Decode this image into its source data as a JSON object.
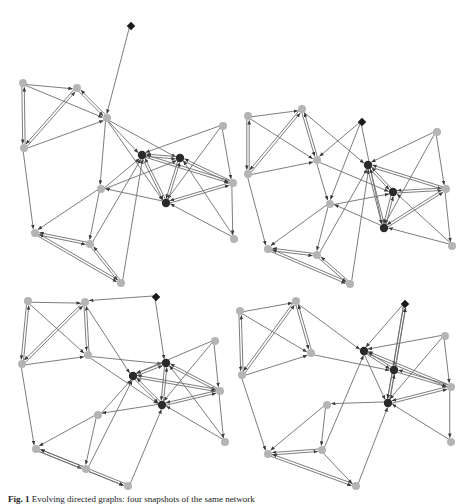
{
  "figure": {
    "caption_label": "Fig. 1",
    "caption_text": "Evolving directed graphs: four snapshots of the same network",
    "colors": {
      "edge": "#6e6e6e",
      "node_light": "#b4b4b4",
      "node_dark": "#2a2a2a",
      "diamond": "#1a1a1a"
    },
    "panels": [
      {
        "name": "panel-top-left",
        "nodes": [
          {
            "id": "d",
            "x": 131,
            "y": 26,
            "type": "diamond"
          },
          {
            "id": "a",
            "x": 23,
            "y": 83,
            "type": "light"
          },
          {
            "id": "b",
            "x": 77,
            "y": 88,
            "type": "light"
          },
          {
            "id": "c",
            "x": 107,
            "y": 118,
            "type": "light"
          },
          {
            "id": "e",
            "x": 223,
            "y": 126,
            "type": "light"
          },
          {
            "id": "f",
            "x": 24,
            "y": 148,
            "type": "light"
          },
          {
            "id": "g",
            "x": 142,
            "y": 155,
            "type": "dark"
          },
          {
            "id": "h",
            "x": 180,
            "y": 158,
            "type": "dark"
          },
          {
            "id": "i",
            "x": 233,
            "y": 183,
            "type": "light"
          },
          {
            "id": "j",
            "x": 101,
            "y": 189,
            "type": "light"
          },
          {
            "id": "k",
            "x": 166,
            "y": 203,
            "type": "dark"
          },
          {
            "id": "l",
            "x": 35,
            "y": 233,
            "type": "light"
          },
          {
            "id": "m",
            "x": 90,
            "y": 244,
            "type": "light"
          },
          {
            "id": "n",
            "x": 234,
            "y": 239,
            "type": "light"
          },
          {
            "id": "o",
            "x": 121,
            "y": 283,
            "type": "light"
          }
        ],
        "edges": [
          [
            "d",
            "c"
          ],
          [
            "a",
            "b"
          ],
          [
            "a",
            "f"
          ],
          [
            "f",
            "a"
          ],
          [
            "a",
            "c"
          ],
          [
            "b",
            "f"
          ],
          [
            "f",
            "b"
          ],
          [
            "b",
            "c"
          ],
          [
            "c",
            "b"
          ],
          [
            "f",
            "c"
          ],
          [
            "c",
            "j"
          ],
          [
            "c",
            "g"
          ],
          [
            "c",
            "h"
          ],
          [
            "c",
            "k"
          ],
          [
            "e",
            "g"
          ],
          [
            "e",
            "i"
          ],
          [
            "e",
            "k"
          ],
          [
            "g",
            "h"
          ],
          [
            "h",
            "g"
          ],
          [
            "g",
            "i"
          ],
          [
            "h",
            "i"
          ],
          [
            "i",
            "g"
          ],
          [
            "i",
            "h"
          ],
          [
            "g",
            "k"
          ],
          [
            "k",
            "g"
          ],
          [
            "h",
            "k"
          ],
          [
            "k",
            "h"
          ],
          [
            "i",
            "k"
          ],
          [
            "k",
            "i"
          ],
          [
            "j",
            "g"
          ],
          [
            "j",
            "h"
          ],
          [
            "k",
            "j"
          ],
          [
            "n",
            "k"
          ],
          [
            "n",
            "h"
          ],
          [
            "i",
            "n"
          ],
          [
            "f",
            "l"
          ],
          [
            "j",
            "l"
          ],
          [
            "j",
            "m"
          ],
          [
            "l",
            "m"
          ],
          [
            "m",
            "l"
          ],
          [
            "l",
            "o"
          ],
          [
            "o",
            "l"
          ],
          [
            "m",
            "o"
          ],
          [
            "o",
            "m"
          ],
          [
            "o",
            "g"
          ],
          [
            "m",
            "g"
          ]
        ]
      },
      {
        "name": "panel-top-right",
        "nodes": [
          {
            "id": "a",
            "x": 248,
            "y": 116,
            "type": "light"
          },
          {
            "id": "b",
            "x": 302,
            "y": 109,
            "type": "light"
          },
          {
            "id": "d",
            "x": 362,
            "y": 122,
            "type": "diamond"
          },
          {
            "id": "e",
            "x": 437,
            "y": 132,
            "type": "light"
          },
          {
            "id": "c",
            "x": 317,
            "y": 160,
            "type": "light"
          },
          {
            "id": "g",
            "x": 368,
            "y": 165,
            "type": "dark"
          },
          {
            "id": "f",
            "x": 248,
            "y": 174,
            "type": "light"
          },
          {
            "id": "h",
            "x": 393,
            "y": 192,
            "type": "dark"
          },
          {
            "id": "i",
            "x": 446,
            "y": 189,
            "type": "light"
          },
          {
            "id": "j",
            "x": 330,
            "y": 204,
            "type": "light"
          },
          {
            "id": "k",
            "x": 384,
            "y": 228,
            "type": "dark"
          },
          {
            "id": "l",
            "x": 268,
            "y": 249,
            "type": "light"
          },
          {
            "id": "m",
            "x": 317,
            "y": 255,
            "type": "light"
          },
          {
            "id": "n",
            "x": 452,
            "y": 246,
            "type": "light"
          },
          {
            "id": "o",
            "x": 350,
            "y": 284,
            "type": "light"
          }
        ],
        "edges": [
          [
            "a",
            "b"
          ],
          [
            "a",
            "f"
          ],
          [
            "f",
            "a"
          ],
          [
            "a",
            "c"
          ],
          [
            "b",
            "f"
          ],
          [
            "f",
            "b"
          ],
          [
            "b",
            "c"
          ],
          [
            "c",
            "b"
          ],
          [
            "f",
            "c"
          ],
          [
            "b",
            "g"
          ],
          [
            "d",
            "c"
          ],
          [
            "d",
            "k"
          ],
          [
            "d",
            "j"
          ],
          [
            "c",
            "j"
          ],
          [
            "c",
            "h"
          ],
          [
            "e",
            "g"
          ],
          [
            "e",
            "i"
          ],
          [
            "e",
            "k"
          ],
          [
            "g",
            "h"
          ],
          [
            "h",
            "g"
          ],
          [
            "g",
            "i"
          ],
          [
            "i",
            "g"
          ],
          [
            "h",
            "i"
          ],
          [
            "i",
            "h"
          ],
          [
            "g",
            "k"
          ],
          [
            "k",
            "g"
          ],
          [
            "h",
            "k"
          ],
          [
            "k",
            "h"
          ],
          [
            "i",
            "k"
          ],
          [
            "k",
            "i"
          ],
          [
            "j",
            "h"
          ],
          [
            "k",
            "j"
          ],
          [
            "n",
            "k"
          ],
          [
            "n",
            "h"
          ],
          [
            "i",
            "n"
          ],
          [
            "f",
            "l"
          ],
          [
            "j",
            "l"
          ],
          [
            "j",
            "m"
          ],
          [
            "l",
            "m"
          ],
          [
            "m",
            "l"
          ],
          [
            "l",
            "o"
          ],
          [
            "o",
            "l"
          ],
          [
            "m",
            "o"
          ],
          [
            "o",
            "m"
          ],
          [
            "o",
            "g"
          ],
          [
            "m",
            "g"
          ]
        ]
      },
      {
        "name": "panel-bottom-left",
        "nodes": [
          {
            "id": "a",
            "x": 28,
            "y": 301,
            "type": "light"
          },
          {
            "id": "b",
            "x": 85,
            "y": 302,
            "type": "light"
          },
          {
            "id": "d",
            "x": 156,
            "y": 297,
            "type": "diamond"
          },
          {
            "id": "e",
            "x": 215,
            "y": 341,
            "type": "light"
          },
          {
            "id": "c",
            "x": 88,
            "y": 355,
            "type": "light"
          },
          {
            "id": "f",
            "x": 22,
            "y": 364,
            "type": "light"
          },
          {
            "id": "h",
            "x": 166,
            "y": 363,
            "type": "dark"
          },
          {
            "id": "g",
            "x": 133,
            "y": 376,
            "type": "dark"
          },
          {
            "id": "i",
            "x": 220,
            "y": 391,
            "type": "light"
          },
          {
            "id": "k",
            "x": 162,
            "y": 405,
            "type": "dark"
          },
          {
            "id": "j",
            "x": 98,
            "y": 415,
            "type": "light"
          },
          {
            "id": "n",
            "x": 225,
            "y": 442,
            "type": "light"
          },
          {
            "id": "l",
            "x": 36,
            "y": 449,
            "type": "light"
          },
          {
            "id": "m",
            "x": 86,
            "y": 469,
            "type": "light"
          },
          {
            "id": "o",
            "x": 128,
            "y": 486,
            "type": "light"
          }
        ],
        "edges": [
          [
            "a",
            "b"
          ],
          [
            "a",
            "f"
          ],
          [
            "f",
            "a"
          ],
          [
            "a",
            "c"
          ],
          [
            "b",
            "f"
          ],
          [
            "f",
            "b"
          ],
          [
            "b",
            "c"
          ],
          [
            "c",
            "b"
          ],
          [
            "f",
            "c"
          ],
          [
            "d",
            "b"
          ],
          [
            "d",
            "h"
          ],
          [
            "c",
            "h"
          ],
          [
            "b",
            "g"
          ],
          [
            "c",
            "k"
          ],
          [
            "e",
            "g"
          ],
          [
            "e",
            "i"
          ],
          [
            "e",
            "k"
          ],
          [
            "g",
            "h"
          ],
          [
            "h",
            "g"
          ],
          [
            "g",
            "i"
          ],
          [
            "h",
            "i"
          ],
          [
            "i",
            "g"
          ],
          [
            "i",
            "h"
          ],
          [
            "g",
            "k"
          ],
          [
            "k",
            "g"
          ],
          [
            "h",
            "k"
          ],
          [
            "k",
            "h"
          ],
          [
            "i",
            "k"
          ],
          [
            "k",
            "i"
          ],
          [
            "j",
            "g"
          ],
          [
            "k",
            "j"
          ],
          [
            "n",
            "k"
          ],
          [
            "n",
            "h"
          ],
          [
            "i",
            "n"
          ],
          [
            "f",
            "l"
          ],
          [
            "j",
            "l"
          ],
          [
            "j",
            "m"
          ],
          [
            "l",
            "m"
          ],
          [
            "m",
            "l"
          ],
          [
            "l",
            "o"
          ],
          [
            "o",
            "l"
          ],
          [
            "m",
            "o"
          ],
          [
            "o",
            "k"
          ],
          [
            "m",
            "g"
          ]
        ]
      },
      {
        "name": "panel-bottom-right",
        "nodes": [
          {
            "id": "a",
            "x": 240,
            "y": 311,
            "type": "light"
          },
          {
            "id": "b",
            "x": 296,
            "y": 301,
            "type": "light"
          },
          {
            "id": "d",
            "x": 405,
            "y": 304,
            "type": "diamond"
          },
          {
            "id": "e",
            "x": 445,
            "y": 336,
            "type": "light"
          },
          {
            "id": "c",
            "x": 311,
            "y": 353,
            "type": "light"
          },
          {
            "id": "g",
            "x": 364,
            "y": 351,
            "type": "dark"
          },
          {
            "id": "f",
            "x": 242,
            "y": 375,
            "type": "light"
          },
          {
            "id": "h",
            "x": 394,
            "y": 370,
            "type": "dark"
          },
          {
            "id": "i",
            "x": 451,
            "y": 387,
            "type": "light"
          },
          {
            "id": "k",
            "x": 388,
            "y": 403,
            "type": "dark"
          },
          {
            "id": "j",
            "x": 327,
            "y": 405,
            "type": "light"
          },
          {
            "id": "n",
            "x": 451,
            "y": 442,
            "type": "light"
          },
          {
            "id": "l",
            "x": 268,
            "y": 454,
            "type": "light"
          },
          {
            "id": "m",
            "x": 322,
            "y": 450,
            "type": "light"
          },
          {
            "id": "o",
            "x": 356,
            "y": 486,
            "type": "light"
          }
        ],
        "edges": [
          [
            "a",
            "b"
          ],
          [
            "a",
            "f"
          ],
          [
            "f",
            "a"
          ],
          [
            "a",
            "c"
          ],
          [
            "b",
            "f"
          ],
          [
            "f",
            "b"
          ],
          [
            "b",
            "c"
          ],
          [
            "c",
            "b"
          ],
          [
            "f",
            "c"
          ],
          [
            "b",
            "g"
          ],
          [
            "d",
            "g"
          ],
          [
            "d",
            "h"
          ],
          [
            "h",
            "d"
          ],
          [
            "d",
            "k"
          ],
          [
            "k",
            "d"
          ],
          [
            "c",
            "h"
          ],
          [
            "e",
            "g"
          ],
          [
            "e",
            "i"
          ],
          [
            "e",
            "k"
          ],
          [
            "g",
            "h"
          ],
          [
            "h",
            "g"
          ],
          [
            "g",
            "i"
          ],
          [
            "h",
            "i"
          ],
          [
            "i",
            "g"
          ],
          [
            "i",
            "h"
          ],
          [
            "g",
            "k"
          ],
          [
            "h",
            "k"
          ],
          [
            "k",
            "h"
          ],
          [
            "i",
            "k"
          ],
          [
            "k",
            "i"
          ],
          [
            "k",
            "j"
          ],
          [
            "n",
            "k"
          ],
          [
            "i",
            "n"
          ],
          [
            "f",
            "l"
          ],
          [
            "j",
            "l"
          ],
          [
            "j",
            "m"
          ],
          [
            "l",
            "m"
          ],
          [
            "m",
            "l"
          ],
          [
            "l",
            "o"
          ],
          [
            "o",
            "l"
          ],
          [
            "m",
            "o"
          ],
          [
            "o",
            "k"
          ],
          [
            "m",
            "g"
          ]
        ]
      }
    ]
  }
}
